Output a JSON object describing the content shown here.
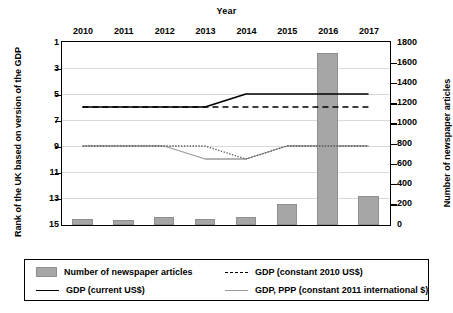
{
  "chart_data": {
    "type": "line",
    "title": "",
    "xlabel": "Year",
    "ylabel": "Rank of the UK based on version of the GDP",
    "y2label": "Number of newspaper articles",
    "categories": [
      "2010",
      "2011",
      "2012",
      "2013",
      "2014",
      "2015",
      "2016",
      "2017"
    ],
    "x": [
      2010,
      2011,
      2012,
      2013,
      2014,
      2015,
      2016,
      2017
    ],
    "ylim": [
      1,
      15
    ],
    "yticks": [
      1,
      3,
      5,
      7,
      9,
      11,
      13,
      15
    ],
    "y2lim": [
      0,
      1800
    ],
    "y2ticks": [
      0,
      200,
      400,
      600,
      800,
      1000,
      1200,
      1400,
      1600,
      1800
    ],
    "y_inverted": true,
    "grid": true,
    "legend_position": "bottom",
    "series": [
      {
        "name": "Number of newspaper articles",
        "type": "bar",
        "axis": "y2",
        "color": "#a6a6a6",
        "values": [
          60,
          45,
          80,
          55,
          78,
          210,
          1700,
          290
        ]
      },
      {
        "name": "GDP (current US$)",
        "type": "line",
        "axis": "y",
        "style": "solid",
        "color": "#000000",
        "values": [
          6,
          6,
          6,
          6,
          5,
          5,
          5,
          5
        ]
      },
      {
        "name": "GDP (constant 2010 US$)",
        "type": "line",
        "axis": "y",
        "style": "dashed",
        "color": "#000000",
        "values": [
          6,
          6,
          6,
          6,
          6,
          6,
          6,
          6
        ]
      },
      {
        "name": "GDP, PPP (constant 2011 international $)",
        "type": "line",
        "axis": "y",
        "style": "solid",
        "color": "#9a9a9a",
        "values": [
          9,
          9,
          9,
          10,
          10,
          9,
          9,
          9
        ]
      },
      {
        "name": "GDP (constant 2010 US$) rank path",
        "type": "line",
        "axis": "y",
        "style": "dotted",
        "color": "#555555",
        "values": [
          9,
          9,
          9,
          9,
          10,
          9,
          9,
          9
        ]
      }
    ]
  },
  "axes": {
    "top_title": "Year",
    "left_label": "Rank of the UK based on version of the GDP",
    "right_label": "Number of newspaper articles",
    "x_labels": [
      "2010",
      "2011",
      "2012",
      "2013",
      "2014",
      "2015",
      "2016",
      "2017"
    ],
    "y_left_ticks": [
      "1",
      "3",
      "5",
      "7",
      "9",
      "11",
      "13",
      "15"
    ],
    "y_right_ticks": [
      "1800",
      "1600",
      "1400",
      "1200",
      "1000",
      "800",
      "600",
      "400",
      "200",
      "0"
    ]
  },
  "legend": {
    "items": [
      {
        "label": "Number of newspaper articles",
        "marker": "bar-swatch",
        "color": "#a6a6a6"
      },
      {
        "label": "GDP (constant 2010 US$)",
        "marker": "dashed-line",
        "color": "#000000"
      },
      {
        "label": "GDP (current US$)",
        "marker": "solid-line",
        "color": "#000000"
      },
      {
        "label": "GDP, PPP (constant 2011 international $)",
        "marker": "solid-gray-line",
        "color": "#9a9a9a"
      }
    ]
  },
  "colors": {
    "bar": "#a6a6a6",
    "line_black": "#000000",
    "line_gray": "#9a9a9a",
    "grid": "#d9d9d9",
    "axis": "#000000"
  }
}
